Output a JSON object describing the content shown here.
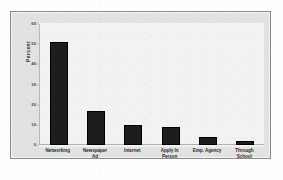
{
  "chart_data": {
    "type": "bar",
    "title": "",
    "xlabel": "",
    "ylabel": "Percent",
    "ylim": [
      0,
      60
    ],
    "ytick_values": [
      0,
      10,
      20,
      30,
      40,
      50,
      60
    ],
    "ytick_labels": [
      "0",
      "10",
      "20",
      "30",
      "40",
      "50",
      "60"
    ],
    "grid": false,
    "legend": "none",
    "bar_color": "#1d1d1d",
    "plot_background": "#f2f2f2",
    "panel_background": "#e2e2e2",
    "panel_border_color": "#8a8a8a",
    "axis_color": "#b9b9b9",
    "categories": [
      "Networking",
      "Newspaper Ad",
      "Internet",
      "Apply In Person",
      "Emp. Agency",
      "Through School"
    ],
    "category_lines": [
      [
        "Networking"
      ],
      [
        "Newspaper",
        "Ad"
      ],
      [
        "Internet"
      ],
      [
        "Apply In",
        "Person"
      ],
      [
        "Emp. Agency"
      ],
      [
        "Through",
        "School"
      ]
    ],
    "values": [
      51,
      17,
      10,
      9,
      4,
      2
    ]
  }
}
